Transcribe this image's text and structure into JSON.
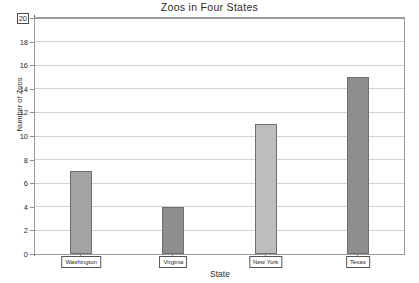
{
  "chart_data": {
    "type": "bar",
    "title": "Zoos in Four States",
    "xlabel": "State",
    "ylabel": "Number of Zoos",
    "categories": [
      "Washington",
      "Virginia",
      "New York",
      "Texas"
    ],
    "values": [
      7,
      4,
      11,
      15
    ],
    "ylim": [
      0,
      20
    ],
    "ytick_labels": [
      "0",
      "2",
      "4",
      "6",
      "8",
      "10",
      "12",
      "14",
      "16",
      "18",
      "20"
    ],
    "ytick_values": [
      0,
      2,
      4,
      6,
      8,
      10,
      12,
      14,
      16,
      18,
      20
    ],
    "grid": true,
    "legend": "none",
    "series": [
      {
        "name": "Number of Zoos",
        "values": [
          7,
          4,
          11,
          15
        ]
      }
    ],
    "bar_colors": [
      "#a3a3a3",
      "#8e8e8e",
      "#bdbdbd",
      "#8e8e8e"
    ],
    "selected_tick_label": "20"
  },
  "colors": {
    "plot_border": "#9a9a9a",
    "gridline": "#d2d2d2",
    "axis_line": "#5d5d5d",
    "text": "#2b2b2b",
    "background": "#ffffff"
  }
}
